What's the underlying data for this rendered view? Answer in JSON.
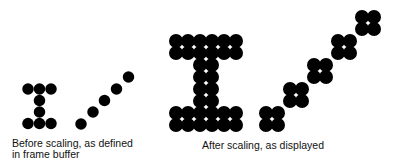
{
  "captions": {
    "before": {
      "line1": "Before scaling, as defined",
      "line2": "in frame buffer"
    },
    "after": {
      "line1": "After scaling, as displayed"
    }
  },
  "colors": {
    "dot": "#000000",
    "background": "#ffffff"
  },
  "before_scaling": {
    "dot_diameter": 11.5,
    "letter_I_dots": [
      [
        28,
        89
      ],
      [
        39.5,
        89
      ],
      [
        51,
        89
      ],
      [
        39.5,
        100.5
      ],
      [
        39.5,
        112
      ],
      [
        28,
        123.5
      ],
      [
        39.5,
        123.5
      ],
      [
        51,
        123.5
      ]
    ],
    "diagonal_dots": [
      [
        81,
        124
      ],
      [
        93,
        112
      ],
      [
        104.5,
        100.5
      ],
      [
        116.5,
        89
      ],
      [
        128.5,
        77
      ]
    ]
  },
  "after_scaling": {
    "scale_factor": 2,
    "dot_diameter": 14,
    "grid_spacing": 12,
    "letter_I_blocks": [
      [
        182,
        47
      ],
      [
        206,
        47
      ],
      [
        230,
        47
      ],
      [
        206,
        71
      ],
      [
        206,
        95
      ],
      [
        182,
        119
      ],
      [
        206,
        119
      ],
      [
        230,
        119
      ]
    ],
    "diagonal_blocks": [
      [
        272,
        119
      ],
      [
        296,
        95
      ],
      [
        320,
        71
      ],
      [
        344,
        47
      ],
      [
        368,
        23
      ]
    ]
  }
}
